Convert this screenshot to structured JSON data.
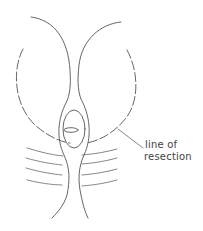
{
  "diagram": {
    "labels": {
      "line_of_resection_line1": "line of",
      "line_of_resection_line2": "resection"
    },
    "colors": {
      "stroke": "#555555",
      "background": "#ffffff"
    }
  }
}
